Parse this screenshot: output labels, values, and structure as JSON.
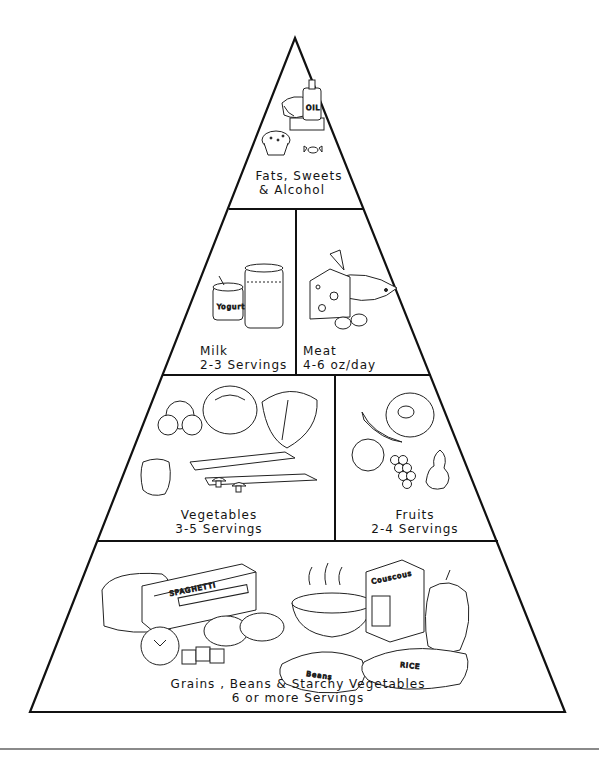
{
  "diagram": {
    "type": "food-pyramid",
    "tiers": [
      {
        "id": "fats",
        "sections": [
          {
            "name": "Fats, Sweets & Alcohol",
            "label_lines": [
              "Fats, Sweets",
              "& Alcohol"
            ],
            "illustration_items": [
              "oil-bottle",
              "cheese-wedge",
              "muffin",
              "wrapped-candy"
            ],
            "item_text": {
              "oil_bottle": "OIL"
            }
          }
        ]
      },
      {
        "id": "dairy-protein",
        "sections": [
          {
            "name": "Milk",
            "label_lines": [
              "Milk",
              "2-3 Servings"
            ],
            "illustration_items": [
              "yogurt-cup",
              "glass-of-milk"
            ],
            "item_text": {
              "yogurt_cup": "Yogurt"
            }
          },
          {
            "name": "Meat",
            "label_lines": [
              "Meat",
              "4-6 oz/day"
            ],
            "illustration_items": [
              "cheese-block",
              "fish",
              "eggs"
            ]
          }
        ]
      },
      {
        "id": "produce",
        "sections": [
          {
            "name": "Vegetables",
            "label_lines": [
              "Vegetables",
              "3-5 Servings"
            ],
            "illustration_items": [
              "broccoli",
              "cabbage",
              "lettuce",
              "carrots",
              "bell-pepper",
              "mushrooms",
              "radishes"
            ]
          },
          {
            "name": "Fruits",
            "label_lines": [
              "Fruits",
              "2-4 Servings"
            ],
            "illustration_items": [
              "melon-slice",
              "banana",
              "apple",
              "grapes",
              "pear"
            ]
          }
        ]
      },
      {
        "id": "grains",
        "sections": [
          {
            "name": "Grains, Beans & Starchy Vegetables",
            "label_lines": [
              "Grains , Beans & Starchy Vegetables",
              "6 or more Servings"
            ],
            "illustration_items": [
              "bread-loaf",
              "spaghetti-box",
              "potatoes",
              "tomato",
              "crackers",
              "steaming-bowl",
              "couscous-box",
              "squash",
              "beans-bag",
              "rice-bag"
            ],
            "item_text": {
              "spaghetti_box": "SPAGHETTI",
              "couscous_box": "Couscous",
              "beans_bag": "Beans",
              "rice_bag": "RICE"
            }
          }
        ]
      }
    ]
  },
  "colors": {
    "line": "#111111",
    "background": "#ffffff",
    "footer_rule": "#8a8a8a"
  }
}
